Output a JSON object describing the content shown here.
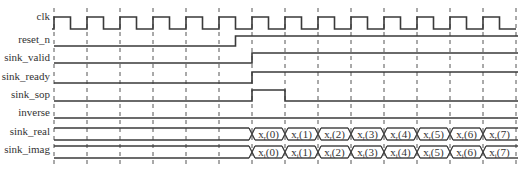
{
  "diagram": {
    "type": "timing",
    "clock": {
      "start_x": 54,
      "period": 33,
      "cycles": 14
    },
    "signals": [
      {
        "name": "clk",
        "kind": "clock"
      },
      {
        "name": "reset_n",
        "kind": "bit",
        "transitions": [
          {
            "at_cycle": 5.5,
            "value": 1
          }
        ],
        "initial": 0
      },
      {
        "name": "sink_valid",
        "kind": "bit",
        "transitions": [
          {
            "at_cycle": 6,
            "value": 1
          }
        ],
        "initial": 0
      },
      {
        "name": "sink_ready",
        "kind": "bit",
        "transitions": [
          {
            "at_cycle": 6,
            "value": 1
          }
        ],
        "initial": 0
      },
      {
        "name": "sink_sop",
        "kind": "bit",
        "transitions": [
          {
            "at_cycle": 6,
            "value": 1
          },
          {
            "at_cycle": 7,
            "value": 0
          }
        ],
        "initial": 0
      },
      {
        "name": "inverse",
        "kind": "bit",
        "transitions": [],
        "initial": 0
      },
      {
        "name": "sink_real",
        "kind": "bus",
        "start_cycle": 6,
        "values": [
          "xr(0)",
          "xr(1)",
          "xr(2)",
          "xr(3)",
          "xr(4)",
          "xr(5)",
          "xr(6)",
          "xr(7)"
        ]
      },
      {
        "name": "sink_imag",
        "kind": "bus",
        "start_cycle": 6,
        "values": [
          "xi(0)",
          "xi(1)",
          "xi(2)",
          "xi(3)",
          "xi(4)",
          "xi(5)",
          "xi(6)",
          "xi(7)"
        ]
      }
    ],
    "bus_labels": {
      "sink_real": [
        {
          "base": "x",
          "sub": "r",
          "idx": "(0)"
        },
        {
          "base": "x",
          "sub": "r",
          "idx": "(1)"
        },
        {
          "base": "x",
          "sub": "r",
          "idx": "(2)"
        },
        {
          "base": "x",
          "sub": "r",
          "idx": "(3)"
        },
        {
          "base": "x",
          "sub": "r",
          "idx": "(4)"
        },
        {
          "base": "x",
          "sub": "r",
          "idx": "(5)"
        },
        {
          "base": "x",
          "sub": "r",
          "idx": "(6)"
        },
        {
          "base": "x",
          "sub": "r",
          "idx": "(7)"
        }
      ],
      "sink_imag": [
        {
          "base": "x",
          "sub": "i",
          "idx": "(0)"
        },
        {
          "base": "x",
          "sub": "i",
          "idx": "(1)"
        },
        {
          "base": "x",
          "sub": "i",
          "idx": "(2)"
        },
        {
          "base": "x",
          "sub": "i",
          "idx": "(3)"
        },
        {
          "base": "x",
          "sub": "i",
          "idx": "(4)"
        },
        {
          "base": "x",
          "sub": "i",
          "idx": "(5)"
        },
        {
          "base": "x",
          "sub": "i",
          "idx": "(6)"
        },
        {
          "base": "x",
          "sub": "i",
          "idx": "(7)"
        }
      ]
    },
    "colors": {
      "line": "#3a3a3a",
      "dash": "#555555",
      "text": "#333333"
    }
  }
}
